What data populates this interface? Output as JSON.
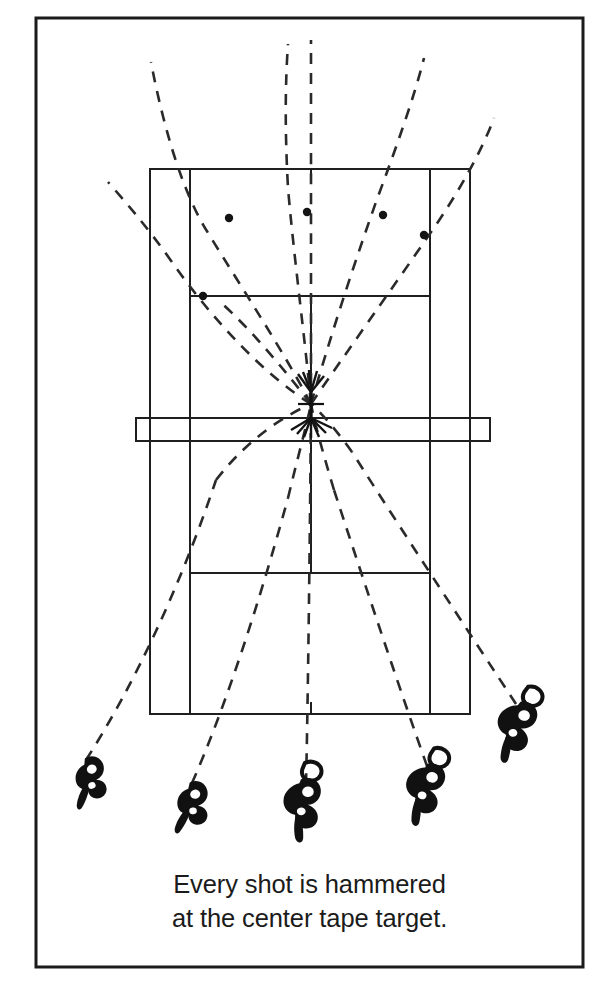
{
  "figure": {
    "caption_lines": [
      "Every shot is hammered",
      "at the center tape target."
    ],
    "colors": {
      "ink": "#1b1b1b",
      "line": "#1f1f1f",
      "paper": "#ffffff",
      "dashed": "#2a2a2a"
    },
    "frame": {
      "name": "page-border",
      "x": 36,
      "y": 18,
      "width": 547,
      "height": 949,
      "stroke_width": 3
    },
    "court": {
      "name": "tennis-court",
      "doubles_left_x": 150,
      "doubles_right_x": 470,
      "singles_left_x": 190,
      "singles_right_x": 430,
      "far_baseline_y": 169,
      "near_baseline_y": 714,
      "far_service_line_y": 296,
      "near_service_line_y": 573,
      "center_service_line_x": 311,
      "center_mark_far_y": 169,
      "center_mark_near_y": 714,
      "line_width": 2
    },
    "net": {
      "name": "net",
      "x": 136,
      "y": 418,
      "width": 354,
      "height": 23,
      "tape_line_y": 429
    },
    "target": {
      "name": "center-tape-target",
      "label": "center tape target",
      "x": 311,
      "y": 404,
      "arm": 13
    },
    "players": [
      {
        "id": "player-1",
        "x": 91,
        "y": 772,
        "rotation": -18,
        "scale": 0.82
      },
      {
        "id": "player-2",
        "x": 194,
        "y": 797,
        "rotation": -10,
        "scale": 0.84
      },
      {
        "id": "player-3",
        "x": 305,
        "y": 795,
        "rotation": -4,
        "scale": 1.0
      },
      {
        "id": "player-4",
        "x": 429,
        "y": 780,
        "rotation": 6,
        "scale": 1.0
      },
      {
        "id": "player-5",
        "x": 521,
        "y": 718,
        "rotation": 10,
        "scale": 1.0
      }
    ],
    "shot_paths": [
      {
        "id": "shot-path-1",
        "from_player": "player-1",
        "description": "outside-in from far left, rising to upper-left beyond baseline",
        "points": [
          [
            86,
            760
          ],
          [
            132,
            688
          ],
          [
            178,
            593
          ],
          [
            216,
            480
          ],
          [
            268,
            425
          ],
          [
            311,
            404
          ]
        ],
        "far_points": [
          [
            311,
            404
          ],
          [
            275,
            352
          ],
          [
            237,
            288
          ],
          [
            205,
            228
          ],
          [
            175,
            140
          ],
          [
            151,
            62
          ]
        ],
        "bounce": {
          "x": 229,
          "y": 218
        }
      },
      {
        "id": "shot-path-2",
        "from_player": "player-2",
        "description": "left-center rally ball through the target",
        "points": [
          [
            192,
            783
          ],
          [
            226,
            706
          ],
          [
            254,
            618
          ],
          [
            280,
            512
          ],
          [
            300,
            440
          ],
          [
            311,
            404
          ]
        ],
        "far_points": [
          [
            311,
            404
          ],
          [
            303,
            332
          ],
          [
            294,
            262
          ],
          [
            288,
            190
          ],
          [
            286,
            112
          ],
          [
            288,
            44
          ]
        ],
        "bounce": {
          "x": 307,
          "y": 212
        }
      },
      {
        "id": "shot-path-3",
        "from_player": "player-3",
        "description": "center straight-line shot over the tape",
        "points": [
          [
            305,
            782
          ],
          [
            308,
            700
          ],
          [
            310,
            600
          ],
          [
            311,
            500
          ],
          [
            311,
            440
          ],
          [
            311,
            404
          ]
        ],
        "far_points": [
          [
            311,
            404
          ],
          [
            311,
            330
          ],
          [
            311,
            258
          ],
          [
            311,
            186
          ],
          [
            311,
            108
          ],
          [
            311,
            40
          ]
        ],
        "bounce": {
          "x": 311,
          "y": 250
        }
      },
      {
        "id": "shot-path-4",
        "from_player": "player-4",
        "description": "right-center ball angled back cross-court",
        "points": [
          [
            427,
            766
          ],
          [
            402,
            690
          ],
          [
            376,
            600
          ],
          [
            348,
            500
          ],
          [
            324,
            436
          ],
          [
            311,
            404
          ]
        ],
        "far_points": [
          [
            311,
            404
          ],
          [
            332,
            338
          ],
          [
            352,
            270
          ],
          [
            374,
            202
          ],
          [
            400,
            122
          ],
          [
            424,
            58
          ]
        ],
        "bounce": {
          "x": 383,
          "y": 215
        }
      },
      {
        "id": "shot-path-5",
        "from_player": "player-5",
        "description": "wide right outside-in trajectory",
        "points": [
          [
            516,
            704
          ],
          [
            477,
            640
          ],
          [
            424,
            552
          ],
          [
            374,
            470
          ],
          [
            332,
            420
          ],
          [
            311,
            404
          ]
        ],
        "far_points": [
          [
            311,
            404
          ],
          [
            346,
            350
          ],
          [
            386,
            290
          ],
          [
            420,
            234
          ],
          [
            456,
            172
          ],
          [
            494,
            118
          ]
        ],
        "bounce": {
          "x": 424,
          "y": 235
        }
      },
      {
        "id": "shot-path-6",
        "from_player": "player-1",
        "description": "short angled ball into the far left service corner",
        "points": [
          [
            311,
            404
          ],
          [
            282,
            368
          ],
          [
            252,
            330
          ],
          [
            224,
            296
          ],
          [
            203,
            296
          ]
        ],
        "far_points": [],
        "bounce": {
          "x": 203,
          "y": 296
        }
      },
      {
        "id": "shot-path-7",
        "from_player": "player-5",
        "description": "low flat ball exiting to the far left edge",
        "points": [
          [
            311,
            404
          ],
          [
            268,
            378
          ],
          [
            224,
            330
          ],
          [
            180,
            268
          ],
          [
            140,
            212
          ],
          [
            108,
            182
          ]
        ],
        "far_points": [],
        "bounce": null
      }
    ],
    "bounce_marks": [
      {
        "id": "bounce-1",
        "x": 229,
        "y": 218,
        "r": 4.2
      },
      {
        "id": "bounce-2",
        "x": 307,
        "y": 212,
        "r": 4.2
      },
      {
        "id": "bounce-3",
        "x": 383,
        "y": 215,
        "r": 4.2
      },
      {
        "id": "bounce-4",
        "x": 424,
        "y": 235,
        "r": 4.2
      },
      {
        "id": "bounce-5",
        "x": 203,
        "y": 296,
        "r": 4.2
      }
    ],
    "burst": {
      "name": "impact-burst",
      "center_x": 311,
      "center_y": 404,
      "rays_above": [
        -62,
        -48,
        -34,
        -20,
        -8,
        8,
        20,
        34,
        48,
        62
      ],
      "rays_below": [
        -70,
        -56,
        -42,
        -28,
        -14,
        14,
        28,
        42,
        56,
        70
      ]
    }
  }
}
